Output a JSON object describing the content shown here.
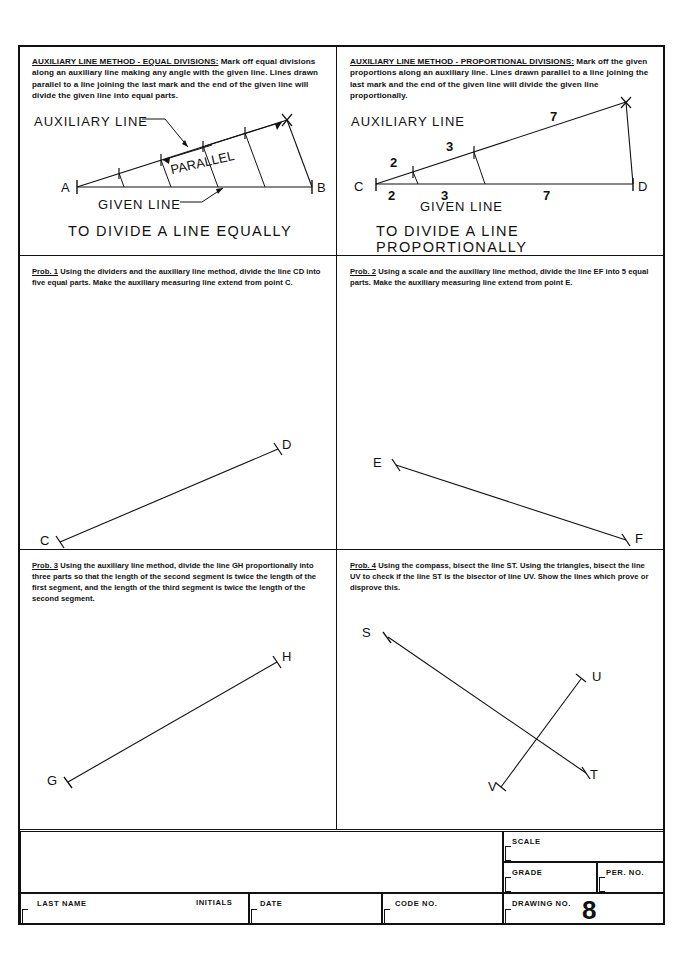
{
  "sheet": {
    "drawing_number": "8",
    "panels": {
      "top_left": {
        "note_header": "AUXILIARY LINE METHOD - EQUAL DIVISIONS:",
        "note_body": " Mark off equal divisions along an auxiliary line making any angle with the given line. Lines drawn parallel to a line joining the last mark and the end of the given line will divide the given line into equal parts.",
        "label_auxiliary": "AUXILIARY   LINE",
        "label_parallel": "PARALLEL",
        "label_given": "GIVEN   LINE",
        "caption": "TO DIVIDE A LINE EQUALLY",
        "point_a": "A",
        "point_b": "B"
      },
      "top_right": {
        "note_header": "AUXILIARY LINE METHOD - PROPORTIONAL DIVISIONS:",
        "note_body": "  Mark off the given proportions along an auxiliary line.  Lines drawn parallel to a line joining the last mark and the end of the given line will divide the given line proportionally.",
        "label_auxiliary": "AUXILIARY   LINE",
        "label_given": "GIVEN   LINE",
        "caption": "TO DIVIDE A LINE PROPORTIONALLY",
        "point_c": "C",
        "point_d": "D",
        "aux_divisions": [
          "2",
          "3",
          "7"
        ],
        "given_divisions": [
          "2",
          "3",
          "7"
        ]
      },
      "prob1": {
        "tag": "Prob. 1",
        "text": "   Using the dividers and the auxiliary line method, divide the line CD into five equal parts.  Make the auxiliary measuring line extend from point C.",
        "point_start": "C",
        "point_end": "D"
      },
      "prob2": {
        "tag": "Prob. 2",
        "text": "   Using a scale and the auxiliary line method, divide the line EF into 5 equal parts.  Make the auxiliary measuring line extend from point E.",
        "point_start": "E",
        "point_end": "F"
      },
      "prob3": {
        "tag": "Prob. 3",
        "text": "   Using the auxiliary line method, divide the line GH proportionally into three parts so that the length of the second segment is twice the length of the first segment, and the length of the third segment is twice the length of the second segment.",
        "point_start": "G",
        "point_end": "H"
      },
      "prob4": {
        "tag": "Prob. 4",
        "text": "    Using the compass, bisect the line ST.  Using the triangles, bisect the line UV to check if the line ST is the bisector of line UV.  Show the lines which prove or disprove this.",
        "point_s": "S",
        "point_t": "T",
        "point_u": "U",
        "point_v": "V"
      }
    },
    "title_block": {
      "scale": "SCALE",
      "grade": "GRADE",
      "per_no": "PER.  NO.",
      "last_name": "LAST   NAME",
      "initials": "INITIALS",
      "date": "DATE",
      "code_no": "CODE   NO.",
      "drawing_no": "DRAWING   NO."
    }
  }
}
